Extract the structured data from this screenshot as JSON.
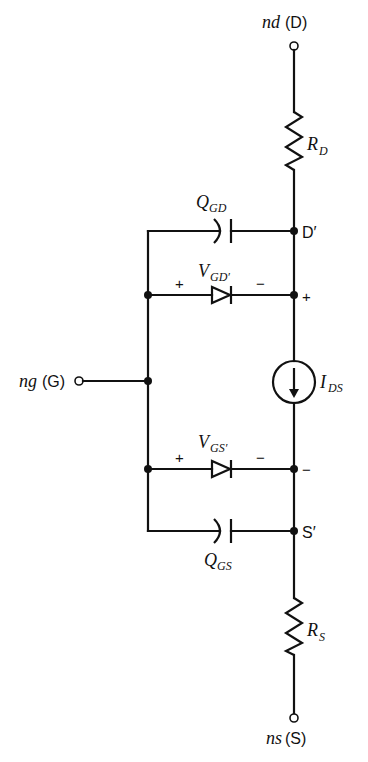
{
  "diagram": {
    "type": "MOSFET equivalent circuit schematic",
    "terminals": {
      "drain": {
        "node": "nd",
        "name": "(D)"
      },
      "gate": {
        "node": "ng",
        "name": "(G)"
      },
      "source": {
        "node": "ns",
        "name": "(S)"
      }
    },
    "components": {
      "rd": {
        "symbol": "R",
        "sub": "D"
      },
      "rs": {
        "symbol": "R",
        "sub": "S"
      },
      "qgd": {
        "symbol": "Q",
        "sub": "GD"
      },
      "qgs": {
        "symbol": "Q",
        "sub": "GS"
      },
      "vgd": {
        "symbol": "V",
        "sub": "GD′"
      },
      "vgs": {
        "symbol": "V",
        "sub": "GS′"
      },
      "ids": {
        "symbol": "I",
        "sub": "DS"
      }
    },
    "internal_nodes": {
      "d_prime": "D′",
      "s_prime": "S′"
    },
    "polarity": {
      "plus": "+",
      "minus": "−"
    },
    "colors": {
      "line": "#111111",
      "background": "#ffffff"
    }
  }
}
